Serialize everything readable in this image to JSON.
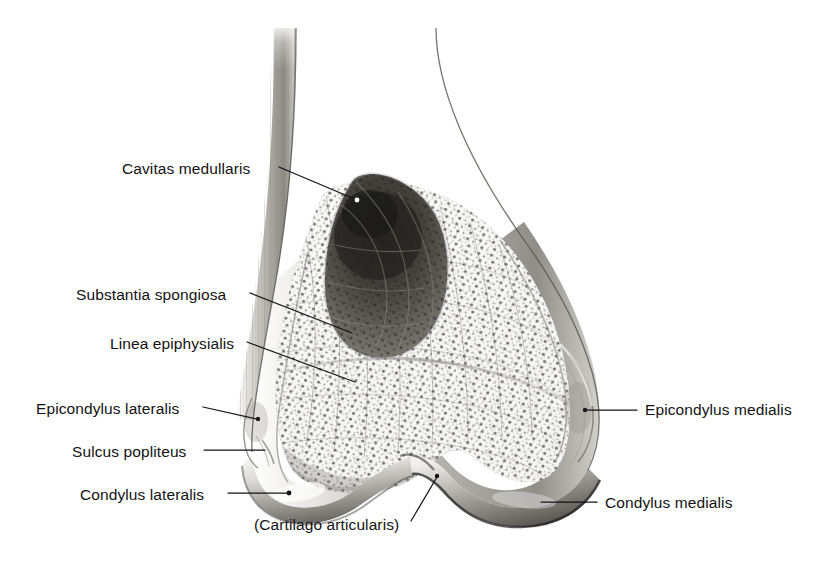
{
  "figure": {
    "background_color": "#ffffff",
    "ink_color": "#131313",
    "bone_tone_light": "#f3f2f0",
    "bone_tone_mid": "#b9b6b1",
    "bone_tone_dark": "#6e6b66",
    "marrow_color": "#3b3936"
  },
  "labels": [
    {
      "id": "cavitas-medullaris",
      "text": "Cavitas medullaris",
      "side": "left",
      "text_x": 122,
      "text_y": 161,
      "leader": {
        "x1": 279,
        "y1": 167,
        "x2": 357,
        "y2": 200
      },
      "dot": {
        "x": 357,
        "y": 200,
        "r": 2.4,
        "fill": "#ffffff"
      }
    },
    {
      "id": "substantia-spongiosa",
      "text": "Substantia spongiosa",
      "side": "left",
      "text_x": 76,
      "text_y": 287,
      "leader": {
        "x1": 250,
        "y1": 293,
        "x2": 352,
        "y2": 333
      },
      "dot": null
    },
    {
      "id": "linea-epiphysialis",
      "text": "Linea epiphysialis",
      "side": "left",
      "text_x": 110,
      "text_y": 336,
      "leader": {
        "x1": 247,
        "y1": 342,
        "x2": 355,
        "y2": 382
      },
      "dot": null
    },
    {
      "id": "epicondylus-lateralis",
      "text": "Epicondylus lateralis",
      "side": "left",
      "text_x": 36,
      "text_y": 401,
      "leader": {
        "x1": 203,
        "y1": 407,
        "x2": 257,
        "y2": 419
      },
      "dot": {
        "x": 258,
        "y": 419,
        "r": 2.2,
        "fill": "#1b1b1b"
      }
    },
    {
      "id": "sulcus-popliteus",
      "text": "Sulcus popliteus",
      "side": "left",
      "text_x": 72,
      "text_y": 444,
      "leader": {
        "x1": 204,
        "y1": 450,
        "x2": 265,
        "y2": 450
      },
      "dot": null
    },
    {
      "id": "condylus-lateralis",
      "text": "Condylus lateralis",
      "side": "left",
      "text_x": 80,
      "text_y": 487,
      "leader": {
        "x1": 228,
        "y1": 493,
        "x2": 288,
        "y2": 493
      },
      "dot": {
        "x": 289,
        "y": 493,
        "r": 2.4,
        "fill": "#141414"
      }
    },
    {
      "id": "cartilago-articularis",
      "text": "(Cartilago articularis)",
      "side": "left",
      "text_x": 254,
      "text_y": 517,
      "leader": {
        "x1": 411,
        "y1": 521,
        "x2": 437,
        "y2": 477
      },
      "dot": {
        "x": 437,
        "y": 476,
        "r": 2.2,
        "fill": "#141414"
      }
    },
    {
      "id": "epicondylus-medialis",
      "text": "Epicondylus medialis",
      "side": "right",
      "text_x": 645,
      "text_y": 402,
      "leader": {
        "x1": 586,
        "y1": 410,
        "x2": 637,
        "y2": 410
      },
      "dot": {
        "x": 585,
        "y": 410,
        "r": 2.2,
        "fill": "#1b1b1b"
      }
    },
    {
      "id": "condylus-medialis",
      "text": "Condylus medialis",
      "side": "right",
      "text_x": 605,
      "text_y": 495,
      "leader": {
        "x1": 541,
        "y1": 502,
        "x2": 597,
        "y2": 502
      },
      "dot": null
    }
  ],
  "anatomy_regions": [
    {
      "id": "corpus-femoris",
      "name": "Shaft of femur (corpus femoris)"
    },
    {
      "id": "substantia-compacta",
      "name": "Compact bone cortex"
    },
    {
      "id": "cavitas-medullaris",
      "name": "Medullary cavity"
    },
    {
      "id": "substantia-spongiosa",
      "name": "Cancellous / spongy bone"
    },
    {
      "id": "condylus-lateralis",
      "name": "Lateral condyle"
    },
    {
      "id": "condylus-medialis",
      "name": "Medial condyle"
    },
    {
      "id": "fossa-intercondylaris",
      "name": "Intercondylar fossa"
    },
    {
      "id": "cartilago-articularis",
      "name": "Articular cartilage"
    }
  ]
}
